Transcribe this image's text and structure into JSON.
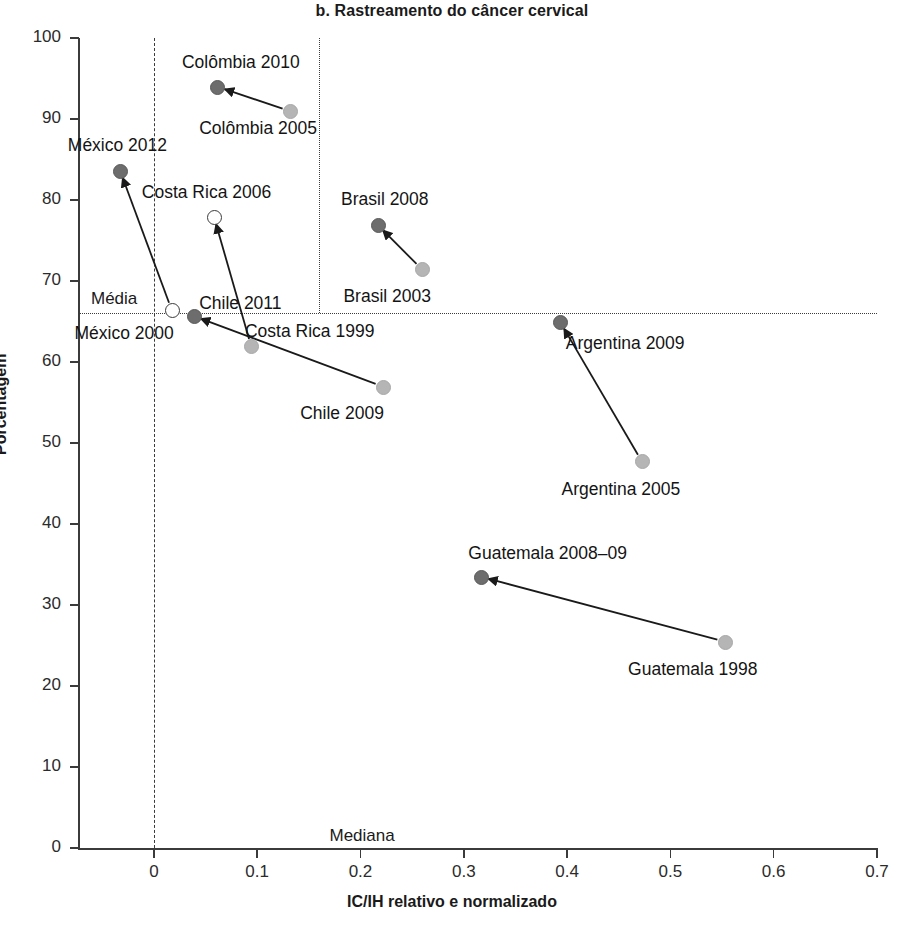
{
  "chart_data": {
    "type": "scatter",
    "title": "b. Rastreamento do câncer cervical",
    "xlabel": "IC/IH relativo e normalizado",
    "ylabel": "Porcentagem",
    "xlim": [
      -0.0725,
      0.7
    ],
    "ylim": [
      0,
      100
    ],
    "xticks": [
      "0",
      "0.1",
      "0.2",
      "0.3",
      "0.4",
      "0.5",
      "0.6",
      "0.7"
    ],
    "xtick_values": [
      0,
      0.1,
      0.2,
      0.3,
      0.4,
      0.5,
      0.6,
      0.7
    ],
    "yticks": [
      "0",
      "10",
      "20",
      "30",
      "40",
      "50",
      "60",
      "70",
      "80",
      "90",
      "100"
    ],
    "ytick_values": [
      0,
      10,
      20,
      30,
      40,
      50,
      60,
      70,
      80,
      90,
      100
    ],
    "grid": false,
    "legend": "none",
    "reference_lines": [
      {
        "name": "media",
        "label": "Média",
        "orientation": "horizontal",
        "value": 66.0,
        "style": "dotted"
      },
      {
        "name": "mediana",
        "label": "Mediana",
        "orientation": "horizontal",
        "value": 0.0,
        "style": "dashed"
      },
      {
        "name": "zero-vertical",
        "label": "",
        "orientation": "vertical",
        "value": 0.0,
        "style": "dashed"
      },
      {
        "name": "median-vertical",
        "label": "",
        "orientation": "vertical",
        "value": 0.16,
        "style": "dotted"
      }
    ],
    "series": [
      {
        "name": "Colômbia",
        "points": [
          {
            "label": "Colômbia 2005",
            "x": 0.131,
            "y": 91.0,
            "marker": "light",
            "label_dx": -90,
            "label_dy": 16
          },
          {
            "label": "Colômbia 2010",
            "x": 0.061,
            "y": 94.0,
            "marker": "dark",
            "label_dx": -35,
            "label_dy": -26
          }
        ],
        "arrow": {
          "from": "Colômbia 2005",
          "to": "Colômbia 2010"
        }
      },
      {
        "name": "México",
        "points": [
          {
            "label": "México 2000",
            "x": 0.017,
            "y": 66.5,
            "marker": "hollow",
            "label_dx": -97,
            "label_dy": 23
          },
          {
            "label": "México 2012",
            "x": -0.033,
            "y": 83.7,
            "marker": "dark",
            "label_dx": -52,
            "label_dy": -26
          }
        ],
        "arrow": {
          "from": "México 2000",
          "to": "México 2012"
        }
      },
      {
        "name": "Costa Rica",
        "points": [
          {
            "label": "Costa Rica 1999",
            "x": 0.094,
            "y": 62.0,
            "marker": "light",
            "label_dx": -6,
            "label_dy": -16
          },
          {
            "label": "Costa Rica 2006",
            "x": 0.058,
            "y": 78.0,
            "marker": "hollow",
            "label_dx": -72,
            "label_dy": -25
          }
        ],
        "arrow": {
          "from": "Costa Rica 1999",
          "to": "Costa Rica 2006"
        }
      },
      {
        "name": "Chile",
        "points": [
          {
            "label": "Chile 2009",
            "x": 0.221,
            "y": 57.0,
            "marker": "light",
            "label_dx": -82,
            "label_dy": 26
          },
          {
            "label": "Chile 2011",
            "x": 0.038,
            "y": 65.7,
            "marker": "dark",
            "label_dy": -14,
            "label_dx": 6
          }
        ],
        "arrow": {
          "from": "Chile 2009",
          "to": "Chile 2011"
        }
      },
      {
        "name": "Brasil",
        "points": [
          {
            "label": "Brasil 2003",
            "x": 0.259,
            "y": 71.5,
            "marker": "light",
            "label_dx": -78,
            "label_dy": 26
          },
          {
            "label": "Brasil 2008",
            "x": 0.216,
            "y": 77.0,
            "marker": "dark",
            "label_dx": -36,
            "label_dy": -26
          }
        ],
        "arrow": {
          "from": "Brasil 2003",
          "to": "Brasil 2008"
        }
      },
      {
        "name": "Argentina",
        "points": [
          {
            "label": "Argentina 2005",
            "x": 0.472,
            "y": 47.8,
            "marker": "light",
            "label_dx": -80,
            "label_dy": 27
          },
          {
            "label": "Argentina 2009",
            "x": 0.393,
            "y": 65.0,
            "marker": "dark",
            "label_dx": 6,
            "label_dy": 20
          }
        ],
        "arrow": {
          "from": "Argentina 2005",
          "to": "Argentina 2009"
        }
      },
      {
        "name": "Guatemala",
        "points": [
          {
            "label": "Guatemala 1998",
            "x": 0.552,
            "y": 25.5,
            "marker": "light",
            "label_dx": -96,
            "label_dy": 27
          },
          {
            "label": "Guatemala 2008–09",
            "x": 0.316,
            "y": 33.5,
            "marker": "dark",
            "label_dx": -12,
            "label_dy": -25
          }
        ],
        "arrow": {
          "from": "Guatemala 1998",
          "to": "Guatemala 2008–09"
        }
      }
    ]
  },
  "colors": {
    "axis": "#3b3b3b",
    "text": "#1a1a1a",
    "marker_recent": "#6d6d6d",
    "marker_earlier": "#b5b5b5",
    "marker_hollow": "#ffffff",
    "background": "#ffffff"
  }
}
